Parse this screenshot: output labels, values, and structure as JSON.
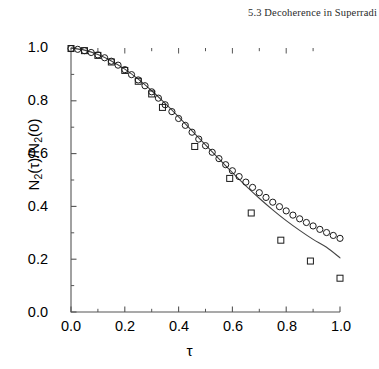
{
  "header": {
    "running_head": "5.3  Decoherence in Superradi"
  },
  "figure": {
    "y_axis_title_main": "N",
    "y_axis_title_full": "N2(τ)/N2(0)",
    "x_axis_title": "τ"
  },
  "axes": {
    "y_ticks": [
      "1.0",
      "0.8",
      "0.6",
      "0.4",
      "0.2",
      "0.0"
    ],
    "x_ticks": [
      "0.0",
      "0.2",
      "0.4",
      "0.6",
      "0.8",
      "1.0"
    ]
  },
  "chart_data": {
    "type": "scatter",
    "title": "",
    "xlabel": "τ",
    "ylabel": "N_2(τ)/N_2(0)",
    "xlim": [
      0.0,
      1.0
    ],
    "ylim": [
      0.0,
      1.0
    ],
    "xticks": [
      0.0,
      0.2,
      0.4,
      0.6,
      0.8,
      1.0
    ],
    "yticks": [
      0.0,
      0.2,
      0.4,
      0.6,
      0.8,
      1.0
    ],
    "minor_ticks": true,
    "grid": false,
    "legend": null,
    "axis_color": "#555555",
    "series": [
      {
        "name": "circles",
        "marker": "open-circle",
        "color": "#1a1a1a",
        "marker_size": 6.2,
        "x": [
          0.0,
          0.025,
          0.05,
          0.075,
          0.1,
          0.125,
          0.15,
          0.175,
          0.2,
          0.225,
          0.25,
          0.275,
          0.3,
          0.325,
          0.35,
          0.375,
          0.4,
          0.425,
          0.45,
          0.475,
          0.5,
          0.525,
          0.55,
          0.575,
          0.6,
          0.625,
          0.65,
          0.675,
          0.7,
          0.725,
          0.75,
          0.775,
          0.8,
          0.825,
          0.85,
          0.875,
          0.9,
          0.925,
          0.95,
          0.975,
          1.0
        ],
        "y": [
          0.998,
          0.995,
          0.99,
          0.983,
          0.974,
          0.963,
          0.95,
          0.935,
          0.918,
          0.899,
          0.879,
          0.857,
          0.834,
          0.81,
          0.785,
          0.759,
          0.733,
          0.707,
          0.681,
          0.655,
          0.63,
          0.605,
          0.581,
          0.558,
          0.535,
          0.513,
          0.492,
          0.472,
          0.452,
          0.434,
          0.416,
          0.399,
          0.383,
          0.367,
          0.353,
          0.339,
          0.326,
          0.313,
          0.301,
          0.29,
          0.279
        ]
      },
      {
        "name": "squares",
        "marker": "open-square",
        "color": "#1a1a1a",
        "marker_size": 6.0,
        "x": [
          0.0,
          0.05,
          0.1,
          0.15,
          0.2,
          0.25,
          0.3,
          0.34,
          0.46,
          0.59,
          0.67,
          0.78,
          0.89,
          1.0
        ],
        "y": [
          0.998,
          0.99,
          0.972,
          0.947,
          0.915,
          0.874,
          0.826,
          0.775,
          0.627,
          0.506,
          0.375,
          0.272,
          0.193,
          0.128
        ]
      }
    ],
    "line": {
      "name": "theory-curve",
      "style": "solid",
      "color": "#444444",
      "width": 1.1,
      "x": [
        0.0,
        0.05,
        0.1,
        0.15,
        0.2,
        0.25,
        0.3,
        0.35,
        0.4,
        0.45,
        0.5,
        0.55,
        0.6,
        0.65,
        0.7,
        0.75,
        0.8,
        0.85,
        0.9,
        0.95,
        1.0
      ],
      "y": [
        1.0,
        0.992,
        0.975,
        0.951,
        0.92,
        0.882,
        0.838,
        0.79,
        0.739,
        0.686,
        0.633,
        0.58,
        0.528,
        0.478,
        0.431,
        0.387,
        0.346,
        0.309,
        0.275,
        0.245,
        0.205
      ]
    }
  }
}
